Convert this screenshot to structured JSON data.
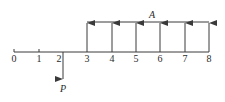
{
  "diagram": {
    "type": "cash-flow-diagram",
    "colors": {
      "line": "#3a3a3a",
      "text": "#2a2a2a",
      "background": "#ffffff"
    },
    "axis": {
      "periods": [
        "0",
        "1",
        "2",
        "3",
        "4",
        "5",
        "6",
        "7",
        "8"
      ]
    },
    "outflow": {
      "label": "P",
      "period": 2,
      "direction": "down"
    },
    "annuity": {
      "label": "A",
      "periods": [
        3,
        4,
        5,
        6,
        7,
        8
      ],
      "direction": "up"
    }
  }
}
